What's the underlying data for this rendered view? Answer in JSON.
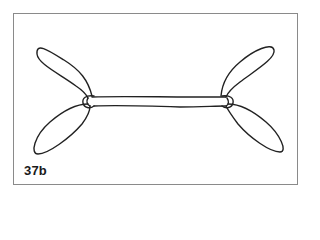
{
  "figure": {
    "label": "37b",
    "stroke_color": "#222222",
    "frame_color": "#8a8a8a"
  }
}
